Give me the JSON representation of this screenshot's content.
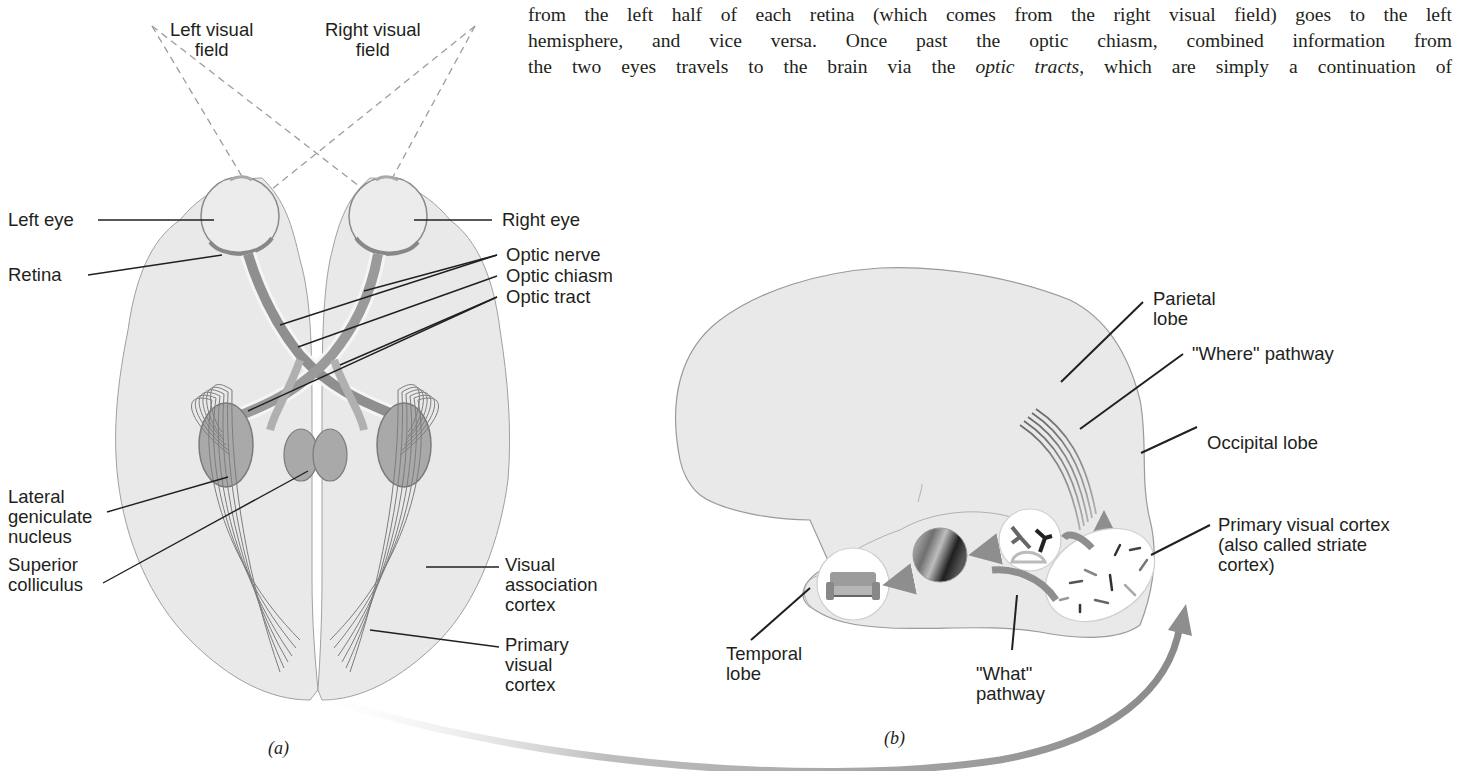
{
  "body_text": {
    "line0": "fibers from each eye cross over to the opposite hemisphere at the optic chiasm (Figure 3.19), so information",
    "line1_pre": "from the left half of each retina (which comes from the right visual field) goes to the left",
    "line2": "hemisphere, and vice versa. Once past the optic chiasm, combined information from",
    "line3_a": "the two eyes travels to the brain via the ",
    "line3_em": "optic tracts",
    "line3_b": ", which are simply a continuation of"
  },
  "figure_a": {
    "caption": "(a)",
    "labels": {
      "left_visual_field_1": "Left visual",
      "left_visual_field_2": "field",
      "right_visual_field_1": "Right visual",
      "right_visual_field_2": "field",
      "left_eye": "Left eye",
      "right_eye": "Right eye",
      "retina": "Retina",
      "optic_nerve": "Optic nerve",
      "optic_chiasm": "Optic chiasm",
      "optic_tract": "Optic tract",
      "lgn_1": "Lateral",
      "lgn_2": "geniculate",
      "lgn_3": "nucleus",
      "sc_1": "Superior",
      "sc_2": "colliculus",
      "vac_1": "Visual",
      "vac_2": "association",
      "vac_3": "cortex",
      "pvc_1": "Primary",
      "pvc_2": "visual",
      "pvc_3": "cortex"
    }
  },
  "figure_b": {
    "caption": "(b)",
    "labels": {
      "parietal_1": "Parietal",
      "parietal_2": "lobe",
      "where_pathway": "\"Where\" pathway",
      "occipital": "Occipital lobe",
      "pvc_1": "Primary visual cortex",
      "pvc_2": "(also called striate",
      "pvc_3": "cortex)",
      "temporal_1": "Temporal",
      "temporal_2": "lobe",
      "what_1": "\"What\"",
      "what_2": "pathway"
    }
  },
  "colors": {
    "text": "#231f20",
    "brain_fill": "#e9e9e9",
    "brain_stroke": "#9a9a9a",
    "pathway_gray": "#8c8c8c",
    "dashed_line": "#9d9d9d",
    "arrow_gray": "#8e8e8e"
  }
}
